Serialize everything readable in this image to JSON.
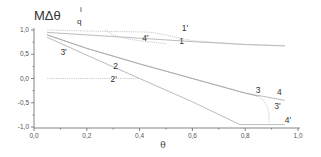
{
  "chart_data": {
    "type": "line",
    "title": "",
    "ylabel": "MΔθ_q^i",
    "ylabel_main": "MΔθ",
    "ylabel_sub": "q",
    "ylabel_sup": "i",
    "xlabel": "θ",
    "xlim": [
      0.0,
      1.0
    ],
    "ylim": [
      -1.0,
      1.0
    ],
    "xticks": [
      "0,0",
      "0,2",
      "0,4",
      "0,6",
      "0,8",
      "1,0"
    ],
    "yticks": [
      "1,0",
      "0,5",
      "0,0",
      "-0,5",
      "-1,0"
    ],
    "grid": false,
    "legend": "inline curve labels",
    "series": [
      {
        "name": "1",
        "style": "solid",
        "x": [
          0.05,
          0.2,
          0.4,
          0.6,
          0.8,
          0.95
        ],
        "y": [
          0.95,
          0.9,
          0.83,
          0.76,
          0.7,
          0.67
        ]
      },
      {
        "name": "1'",
        "style": "dotted",
        "x": [
          0.05,
          0.2,
          0.4,
          0.45,
          0.6,
          0.8,
          0.95
        ],
        "y": [
          1.0,
          0.98,
          0.96,
          0.95,
          0.78,
          0.7,
          0.68
        ]
      },
      {
        "name": "2",
        "style": "solid",
        "x": [
          0.05,
          0.2,
          0.4,
          0.6,
          0.78,
          0.95
        ],
        "y": [
          0.85,
          0.48,
          0.0,
          -0.48,
          -0.95,
          -0.95
        ]
      },
      {
        "name": "2'",
        "style": "dotted",
        "x": [
          0.05,
          0.2,
          0.4
        ],
        "y": [
          0.0,
          0.0,
          0.0
        ]
      },
      {
        "name": "3",
        "style": "solid",
        "x": [
          0.05,
          0.2,
          0.4,
          0.6,
          0.8,
          0.85
        ],
        "y": [
          0.9,
          0.62,
          0.3,
          0.0,
          -0.3,
          -0.37
        ]
      },
      {
        "name": "3'",
        "style": "dotted",
        "x": [
          0.85,
          0.87,
          0.885,
          0.89,
          0.89
        ],
        "y": [
          -0.37,
          -0.45,
          -0.6,
          -0.75,
          -0.9
        ]
      },
      {
        "name": "4",
        "style": "solid",
        "x": [
          0.05,
          0.2,
          0.4,
          0.6,
          0.8,
          0.95
        ],
        "y": [
          0.9,
          0.62,
          0.3,
          0.0,
          -0.3,
          -0.45
        ]
      },
      {
        "name": "4'",
        "style": "dotted",
        "x": [
          0.27,
          0.3,
          0.35,
          0.4,
          0.5
        ],
        "y": [
          1.0,
          0.9,
          0.82,
          0.78,
          0.72
        ]
      }
    ],
    "annotations": [
      {
        "text": "1'",
        "x": 0.56,
        "y": 0.97
      },
      {
        "text": "1",
        "x": 0.55,
        "y": 0.72
      },
      {
        "text": "4'",
        "x": 0.41,
        "y": 0.77
      },
      {
        "text": "3'",
        "x": 0.1,
        "y": 0.48
      },
      {
        "text": "2",
        "x": 0.3,
        "y": 0.2
      },
      {
        "text": "2'",
        "x": 0.29,
        "y": -0.08
      },
      {
        "text": "3",
        "x": 0.84,
        "y": -0.3
      },
      {
        "text": "4",
        "x": 0.92,
        "y": -0.33
      },
      {
        "text": "3'",
        "x": 0.91,
        "y": -0.62
      },
      {
        "text": "4'",
        "x": 0.95,
        "y": -0.92
      }
    ]
  }
}
